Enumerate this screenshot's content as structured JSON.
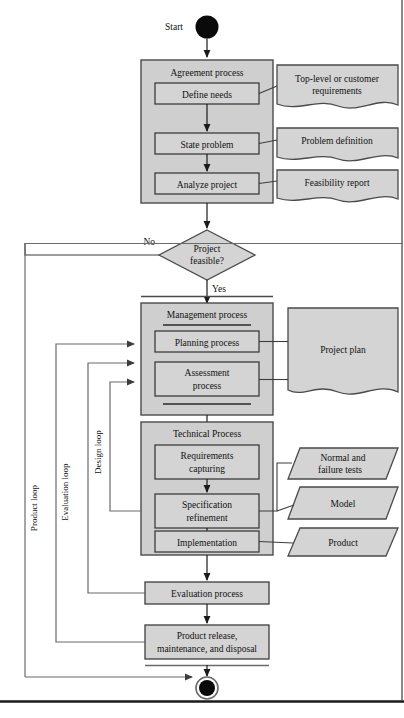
{
  "diagram": {
    "title_visible": false,
    "start": {
      "label": "Start",
      "name": "start-node"
    },
    "end": {
      "label": "",
      "name": "end-node"
    },
    "colors": {
      "node_fill": "#d4d4d4",
      "container_fill": "#cfcfcf",
      "stroke": "#4a4a4a",
      "text": "#111111",
      "frame": "#6b6b6b",
      "rule": "#1a1a1a"
    },
    "containers": [
      {
        "id": "agreement",
        "title": "Agreement process"
      },
      {
        "id": "management",
        "title": "Management process"
      },
      {
        "id": "technical",
        "title": "Technical Process"
      }
    ],
    "nodes": [
      {
        "id": "define-needs",
        "label": "Define needs"
      },
      {
        "id": "state-problem",
        "label": "State problem"
      },
      {
        "id": "analyze-project",
        "label": "Analyze project"
      },
      {
        "id": "planning-process",
        "label": "Planning process"
      },
      {
        "id": "assessment-process",
        "label": "Assessment\nprocess",
        "line1": "Assessment",
        "line2": "process"
      },
      {
        "id": "requirements-capturing",
        "label": "Requirements\ncapturing",
        "line1": "Requirements",
        "line2": "capturing"
      },
      {
        "id": "specification-refinement",
        "label": "Specification\nrefinement",
        "line1": "Specification",
        "line2": "refinement"
      },
      {
        "id": "implementation",
        "label": "Implementation"
      },
      {
        "id": "evaluation-process",
        "label": "Evaluation process"
      },
      {
        "id": "product-release",
        "label": "Product release,\nmaintenance, and disposal",
        "line1": "Product release,",
        "line2": "maintenance, and disposal"
      }
    ],
    "decision": {
      "id": "project-feasible",
      "line1": "Project",
      "line2": "feasible?",
      "branch_no": "No",
      "branch_yes": "Yes"
    },
    "documents": [
      {
        "id": "top-level-requirements",
        "line1": "Top-level or customer",
        "line2": "requirements"
      },
      {
        "id": "problem-definition",
        "line1": "Problem definition",
        "line2": ""
      },
      {
        "id": "feasibility-report",
        "line1": "Feasibility report",
        "line2": ""
      },
      {
        "id": "project-plan",
        "line1": "Project plan",
        "line2": ""
      }
    ],
    "artifacts": [
      {
        "id": "normal-failure-tests",
        "line1": "Normal and",
        "line2": "failure tests"
      },
      {
        "id": "model",
        "line1": "Model",
        "line2": ""
      },
      {
        "id": "product",
        "line1": "Product",
        "line2": ""
      }
    ],
    "loops": [
      {
        "id": "product-loop",
        "label": "Product loop"
      },
      {
        "id": "evaluation-loop",
        "label": "Evaluation loop"
      },
      {
        "id": "design-loop",
        "label": "Design loop"
      }
    ]
  }
}
